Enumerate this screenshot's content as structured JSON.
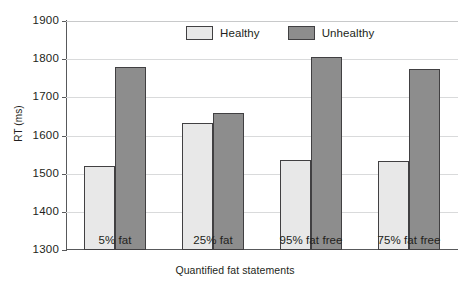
{
  "chart_data": {
    "type": "bar",
    "title": "",
    "xlabel": "Quantified fat statements",
    "ylabel": "RT (ms)",
    "categories": [
      "5% fat",
      "25% fat",
      "95% fat free",
      "75% fat free"
    ],
    "series": [
      {
        "name": "Healthy",
        "values": [
          1521,
          1634,
          1535,
          1534
        ],
        "color": "#e8e8e8"
      },
      {
        "name": "Unhealthy",
        "values": [
          1780,
          1659,
          1806,
          1773
        ],
        "color": "#8d8d8d"
      }
    ],
    "ylim": [
      1300,
      1900
    ],
    "yticks": [
      1300,
      1400,
      1500,
      1600,
      1700,
      1800,
      1900
    ],
    "ytick_labels": [
      "1300",
      "1400",
      "1500",
      "1600",
      "1700",
      "1800",
      "1900"
    ],
    "grid": true,
    "grid_axis": "y",
    "legend_position": "top-center",
    "bar_edge_color": "#414042"
  },
  "legend": {
    "entries": [
      {
        "label": "Healthy"
      },
      {
        "label": "Unhealthy"
      }
    ]
  }
}
